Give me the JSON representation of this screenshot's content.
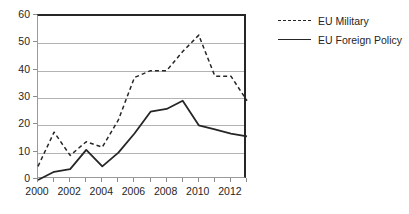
{
  "chart_data": {
    "type": "line",
    "title": "",
    "xlabel": "",
    "ylabel": "",
    "x": [
      2000,
      2001,
      2002,
      2003,
      2004,
      2005,
      2006,
      2007,
      2008,
      2009,
      2010,
      2011,
      2012,
      2013
    ],
    "xlim": [
      2000,
      2013
    ],
    "ylim": [
      0,
      60
    ],
    "ytick_labels": [
      "60",
      "50",
      "40",
      "30",
      "20",
      "10",
      "0"
    ],
    "ytick_values": [
      60,
      50,
      40,
      30,
      20,
      10,
      0
    ],
    "xtick_labels": [
      "2000",
      "2002",
      "2004",
      "2006",
      "2008",
      "2010",
      "2012"
    ],
    "xtick_values": [
      2000,
      2002,
      2004,
      2006,
      2008,
      2010,
      2012
    ],
    "grid": "horizontal",
    "legend_position": "right",
    "series": [
      {
        "name": "EU Military",
        "style": "dashed",
        "color": "#262626",
        "values": [
          5,
          17.5,
          9,
          14,
          12,
          22,
          37.5,
          40,
          40,
          47,
          53,
          38,
          38,
          29
        ]
      },
      {
        "name": "EU Foreign Policy",
        "style": "solid",
        "color": "#262626",
        "values": [
          0,
          3,
          4,
          11,
          5,
          10,
          17,
          25,
          26,
          29,
          20,
          18.5,
          17,
          16
        ]
      }
    ]
  }
}
